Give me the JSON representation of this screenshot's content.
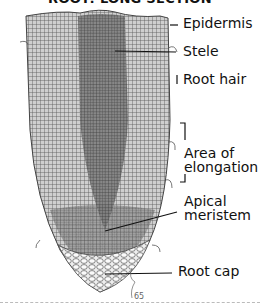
{
  "title": "ROOT: LONG SECTION",
  "labels": {
    "epidermis": "Epidermis",
    "stele": "Stele",
    "root_hair": "Root hair",
    "area_of_elongation_1": "Area of",
    "area_of_elongation_2": "elongation",
    "apical_meristem_1": "Apical",
    "apical_meristem_2": "meristem",
    "root_cap": "Root cap"
  },
  "signature": "65"
}
